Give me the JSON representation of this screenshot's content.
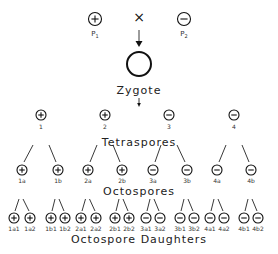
{
  "parents": [
    {
      "sign": "+",
      "label": "P",
      "sub": "1"
    },
    {
      "sign": "-",
      "label": "P",
      "sub": "2"
    }
  ],
  "cross_symbol": "×",
  "zygote_label": "Zygote",
  "tetraspores_label": "Tetraspores",
  "octospores_label": "Octospores",
  "daughters_label": "Octospore Daughters",
  "tetraspores": [
    {
      "id": "1",
      "sign": "+"
    },
    {
      "id": "2",
      "sign": "+"
    },
    {
      "id": "3",
      "sign": "-"
    },
    {
      "id": "4",
      "sign": "-"
    }
  ],
  "octospores": [
    {
      "id": "1a",
      "sign": "+"
    },
    {
      "id": "1b",
      "sign": "+"
    },
    {
      "id": "2a",
      "sign": "+"
    },
    {
      "id": "2b",
      "sign": "+"
    },
    {
      "id": "3a",
      "sign": "-"
    },
    {
      "id": "3b",
      "sign": "-"
    },
    {
      "id": "4a",
      "sign": "-"
    },
    {
      "id": "4b",
      "sign": "-"
    }
  ],
  "daughters": [
    {
      "id": "1a1",
      "sign": "+"
    },
    {
      "id": "1a2",
      "sign": "+"
    },
    {
      "id": "1b1",
      "sign": "+"
    },
    {
      "id": "1b2",
      "sign": "+"
    },
    {
      "id": "2a1",
      "sign": "+"
    },
    {
      "id": "2a2",
      "sign": "+"
    },
    {
      "id": "2b1",
      "sign": "+"
    },
    {
      "id": "2b2",
      "sign": "+"
    },
    {
      "id": "3a1",
      "sign": "-"
    },
    {
      "id": "3a2",
      "sign": "-"
    },
    {
      "id": "3b1",
      "sign": "-"
    },
    {
      "id": "3b2",
      "sign": "-"
    },
    {
      "id": "4a1",
      "sign": "-"
    },
    {
      "id": "4a2",
      "sign": "-"
    },
    {
      "id": "4b1",
      "sign": "-"
    },
    {
      "id": "4b2",
      "sign": "-"
    }
  ]
}
